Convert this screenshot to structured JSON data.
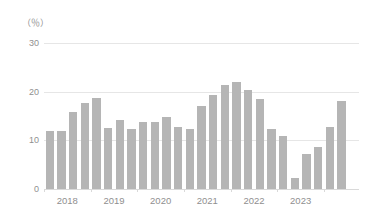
{
  "chart_data": {
    "type": "bar",
    "title": "",
    "subtitle": "",
    "xlabel": "",
    "ylabel": "",
    "unit_label": "（％）",
    "ylim": [
      0,
      30
    ],
    "yticks": [
      0,
      10,
      20,
      30
    ],
    "ytick_labels": [
      "0",
      "10",
      "20",
      "30"
    ],
    "grid": true,
    "legend": "none",
    "categories": [
      "2018Q1",
      "2018Q2",
      "2018Q3",
      "2018Q4",
      "2019Q1",
      "2019Q2",
      "2019Q3",
      "2019Q4",
      "2020Q1",
      "2020Q2",
      "2020Q3",
      "2020Q4",
      "2021Q1",
      "2021Q2",
      "2021Q3",
      "2021Q4",
      "2022Q1",
      "2022Q2",
      "2022Q3",
      "2022Q4",
      "2023Q1",
      "2023Q2",
      "2023Q3",
      "2023Q4",
      "2024Q1",
      "2024Q2",
      "2024Q3"
    ],
    "values": [
      12.0,
      12.0,
      15.8,
      17.7,
      18.7,
      12.5,
      14.2,
      12.4,
      13.8,
      13.8,
      14.8,
      12.8,
      12.4,
      17.0,
      19.3,
      21.3,
      22.0,
      20.3,
      18.5,
      12.4,
      10.8,
      2.2,
      7.2,
      8.6,
      12.7,
      18.0,
      0
    ],
    "xtick_labels": [
      "2018",
      "2019",
      "2020",
      "2021",
      "2022",
      "2023"
    ],
    "bar_color": "#b5b5b5",
    "grid_color": "#e6e6e6",
    "text_color": "#8f8f8f"
  }
}
